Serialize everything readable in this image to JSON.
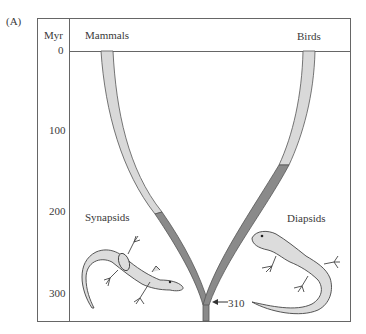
{
  "figure": {
    "panel_label": "(A)",
    "axis": {
      "unit_label": "Myr",
      "ticks": [
        "0",
        "100",
        "200",
        "300"
      ]
    },
    "lineages": {
      "left": "Mammals",
      "right": "Birds"
    },
    "groups": {
      "left": "Synapsids",
      "right": "Diapsids"
    },
    "divergence_marker": "310",
    "colors": {
      "frame": "#555555",
      "branch_light": "#d9d9d9",
      "branch_dark": "#8a8a8a",
      "branch_outline": "#555555",
      "lizard_fill": "#dcdcdc",
      "lizard_outline": "#444444"
    }
  }
}
